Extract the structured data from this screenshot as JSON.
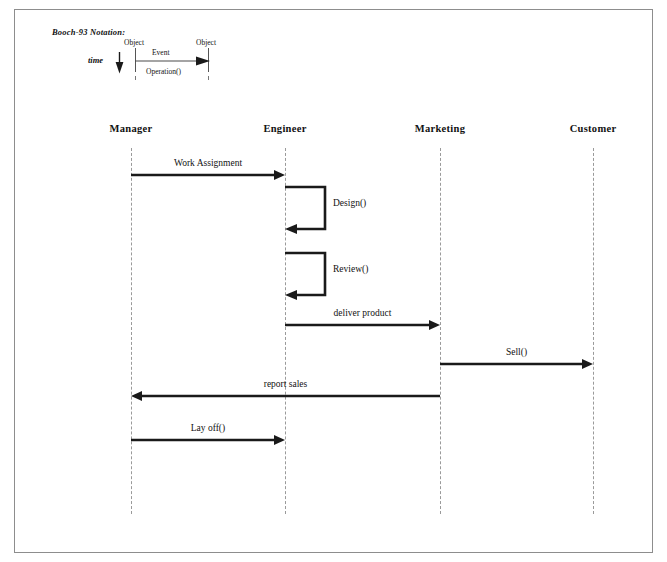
{
  "diagram": {
    "notation_label": "Booch-93 Notation:",
    "legend": {
      "time_label": "time",
      "object_left": "Object",
      "object_right": "Object",
      "event_label": "Event",
      "operation_label": "Operation()",
      "time_arrow_icon": "arrow-down-icon",
      "event_arrow_icon": "arrow-right-icon"
    },
    "lifelines": [
      {
        "name": "Manager",
        "x": 131
      },
      {
        "name": "Engineer",
        "x": 285
      },
      {
        "name": "Marketing",
        "x": 440
      },
      {
        "name": "Customer",
        "x": 593
      }
    ],
    "messages": [
      {
        "label": "Work Assignment",
        "from": "Manager",
        "to": "Engineer",
        "direction": "right",
        "y": 175
      },
      {
        "label": "deliver product",
        "from": "Engineer",
        "to": "Marketing",
        "direction": "right",
        "y": 325
      },
      {
        "label": "Sell()",
        "from": "Marketing",
        "to": "Customer",
        "direction": "right",
        "y": 364
      },
      {
        "label": "report sales",
        "from": "Marketing",
        "to": "Manager",
        "direction": "left",
        "y": 396
      },
      {
        "label": "Lay off()",
        "from": "Manager",
        "to": "Engineer",
        "direction": "right",
        "y": 440
      }
    ],
    "self_messages": [
      {
        "label": "Design()",
        "on": "Engineer",
        "y": 184
      },
      {
        "label": "Review()",
        "on": "Engineer",
        "y": 250
      }
    ],
    "colors": {
      "arrow": "#1a1a1a",
      "lifeline": "#9a9a9a",
      "border": "#8d8d8d",
      "text": "#111111"
    }
  }
}
